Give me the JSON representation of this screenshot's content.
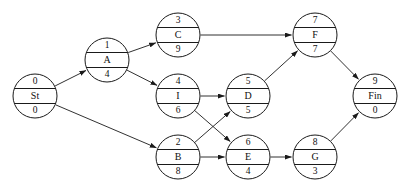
{
  "diagram": {
    "type": "node-network",
    "geometry": {
      "width": 409,
      "height": 193,
      "node_radius": 22
    },
    "colors": {
      "background": "#ffffff",
      "stroke": "#1a1a1a",
      "text": "#101010"
    },
    "nodes": [
      {
        "id": "St",
        "label": "St",
        "top": "0",
        "bottom": "0",
        "cx": 35,
        "cy": 96
      },
      {
        "id": "A",
        "label": "A",
        "top": "1",
        "bottom": "4",
        "cx": 107,
        "cy": 60
      },
      {
        "id": "C",
        "label": "C",
        "top": "3",
        "bottom": "9",
        "cx": 178,
        "cy": 35
      },
      {
        "id": "I",
        "label": "I",
        "top": "4",
        "bottom": "6",
        "cx": 178,
        "cy": 96
      },
      {
        "id": "B",
        "label": "B",
        "top": "2",
        "bottom": "8",
        "cx": 178,
        "cy": 157
      },
      {
        "id": "D",
        "label": "D",
        "top": "5",
        "bottom": "5",
        "cx": 248,
        "cy": 96
      },
      {
        "id": "E",
        "label": "E",
        "top": "6",
        "bottom": "4",
        "cx": 248,
        "cy": 157
      },
      {
        "id": "F",
        "label": "F",
        "top": "7",
        "bottom": "7",
        "cx": 315,
        "cy": 35
      },
      {
        "id": "G",
        "label": "G",
        "top": "8",
        "bottom": "3",
        "cx": 315,
        "cy": 157
      },
      {
        "id": "Fin",
        "label": "Fin",
        "top": "9",
        "bottom": "0",
        "cx": 375,
        "cy": 96
      }
    ],
    "edges": [
      {
        "from": "St",
        "to": "A"
      },
      {
        "from": "St",
        "to": "B"
      },
      {
        "from": "A",
        "to": "C"
      },
      {
        "from": "A",
        "to": "I"
      },
      {
        "from": "C",
        "to": "F"
      },
      {
        "from": "I",
        "to": "D"
      },
      {
        "from": "I",
        "to": "E"
      },
      {
        "from": "B",
        "to": "D"
      },
      {
        "from": "B",
        "to": "E"
      },
      {
        "from": "D",
        "to": "F"
      },
      {
        "from": "E",
        "to": "G"
      },
      {
        "from": "F",
        "to": "Fin"
      },
      {
        "from": "G",
        "to": "Fin"
      }
    ]
  }
}
